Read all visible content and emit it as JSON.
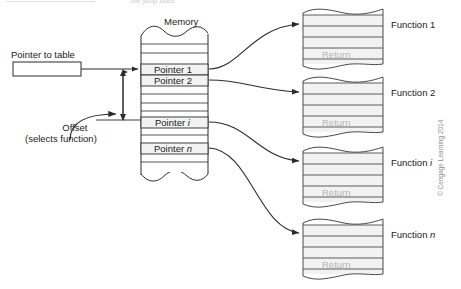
{
  "figure": {
    "caption_strip": "————————————",
    "caption_right": "ble jump used",
    "memory_title": "Memory",
    "pointer_to_table_label": "Pointer to table",
    "offset_label_line1": "Offset",
    "offset_label_line2": "(selects function)",
    "credit": "© Cengage Learning 2014"
  },
  "memory_table": {
    "title": "Memory",
    "entries": [
      {
        "label": "Pointer 1",
        "italic_suffix": ""
      },
      {
        "label": "Pointer 2",
        "italic_suffix": ""
      },
      {
        "label": "Pointer ",
        "italic_suffix": "i"
      },
      {
        "label": "Pointer ",
        "italic_suffix": "n"
      }
    ]
  },
  "functions": [
    {
      "label": "Function 1",
      "italic_suffix": "",
      "return_label": "Return"
    },
    {
      "label": "Function 2",
      "italic_suffix": "",
      "return_label": "Return"
    },
    {
      "label": "Function ",
      "italic_suffix": "i",
      "return_label": "Return"
    },
    {
      "label": "Function ",
      "italic_suffix": "n",
      "return_label": "Return"
    }
  ],
  "colors": {
    "stroke": "#2b2b2b",
    "fill_light": "#f2f2f2",
    "fill_white": "#ffffff",
    "return_text": "#b7b7b7",
    "credit_text": "#8e8e8e"
  }
}
